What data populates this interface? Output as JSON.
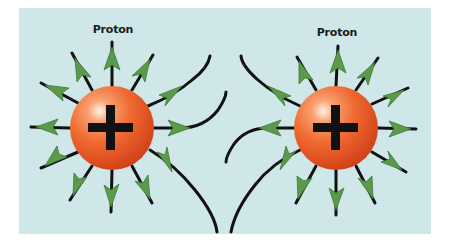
{
  "diagram": {
    "background_color": "#cfe7e9",
    "colors": {
      "field_line": "#111111",
      "arrowhead": "#5b9a4c",
      "arrowhead_edge": "#3f7a35",
      "sphere_light": "#ffe6cf",
      "sphere_mid": "#f06a30",
      "sphere_dark": "#d9421a",
      "sign": "#111111"
    },
    "protons": [
      {
        "label": "Proton",
        "charge_symbol": "+",
        "center": [
          112,
          128
        ],
        "radius": 42,
        "label_pos": [
          113,
          23
        ]
      },
      {
        "label": "Proton",
        "charge_symbol": "+",
        "center": [
          336,
          128
        ],
        "radius": 42,
        "label_pos": [
          337,
          26
        ]
      }
    ],
    "field_line_count_per_proton": 12,
    "interaction": "field lines bend away from each other between the protons (repulsion)"
  }
}
